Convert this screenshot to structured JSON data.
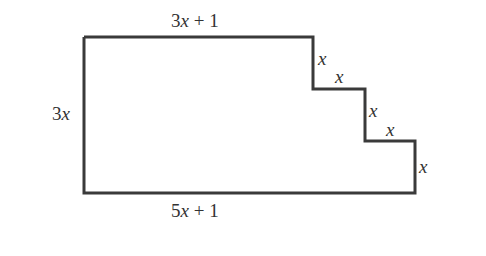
{
  "figure": {
    "type": "staircase-polygon",
    "stroke_color": "#3a3a3a",
    "labels": {
      "top": "3x + 1",
      "left": "3x",
      "bottom": "5x + 1",
      "step1_vertical": "x",
      "step1_horizontal": "x",
      "step2_vertical": "x",
      "step2_horizontal": "x",
      "right_vertical": "x"
    }
  }
}
